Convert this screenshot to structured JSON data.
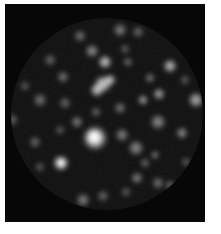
{
  "image": {
    "description": "Grayscale speckle pattern viewed through a circular aperture on a black frame with white page margin",
    "page_background_color": "#ffffff",
    "frame_color": "#070707",
    "speckle_color": "#ffffff",
    "frame": {
      "x": 5,
      "y": 4,
      "width": 200,
      "height": 218
    },
    "aperture": {
      "cx": 102,
      "cy": 110,
      "r": 96
    },
    "blobs": [
      {
        "cx": 90,
        "cy": 134,
        "r": 14,
        "o": 0.95
      },
      {
        "cx": 89,
        "cy": 133,
        "r": 9,
        "o": 1.0
      },
      {
        "cx": 56,
        "cy": 159,
        "r": 9,
        "o": 0.9
      },
      {
        "cx": 56,
        "cy": 159,
        "r": 5,
        "o": 1.0
      },
      {
        "cx": 98,
        "cy": 80,
        "r": 10,
        "o": 0.8
      },
      {
        "cx": 92,
        "cy": 86,
        "r": 8,
        "o": 0.75
      },
      {
        "cx": 105,
        "cy": 76,
        "r": 7,
        "o": 0.7
      },
      {
        "cx": 100,
        "cy": 58,
        "r": 8,
        "o": 0.75
      },
      {
        "cx": 165,
        "cy": 62,
        "r": 8,
        "o": 0.7
      },
      {
        "cx": 191,
        "cy": 96,
        "r": 9,
        "o": 0.65
      },
      {
        "cx": 154,
        "cy": 90,
        "r": 7,
        "o": 0.6
      },
      {
        "cx": 138,
        "cy": 96,
        "r": 6,
        "o": 0.6
      },
      {
        "cx": 87,
        "cy": 47,
        "r": 8,
        "o": 0.5
      },
      {
        "cx": 75,
        "cy": 32,
        "r": 7,
        "o": 0.4
      },
      {
        "cx": 115,
        "cy": 26,
        "r": 8,
        "o": 0.45
      },
      {
        "cx": 133,
        "cy": 28,
        "r": 7,
        "o": 0.35
      },
      {
        "cx": 58,
        "cy": 73,
        "r": 7,
        "o": 0.4
      },
      {
        "cx": 45,
        "cy": 56,
        "r": 7,
        "o": 0.35
      },
      {
        "cx": 35,
        "cy": 96,
        "r": 8,
        "o": 0.4
      },
      {
        "cx": 20,
        "cy": 82,
        "r": 6,
        "o": 0.3
      },
      {
        "cx": 60,
        "cy": 99,
        "r": 7,
        "o": 0.35
      },
      {
        "cx": 72,
        "cy": 118,
        "r": 7,
        "o": 0.45
      },
      {
        "cx": 131,
        "cy": 144,
        "r": 9,
        "o": 0.5
      },
      {
        "cx": 153,
        "cy": 118,
        "r": 9,
        "o": 0.5
      },
      {
        "cx": 177,
        "cy": 129,
        "r": 7,
        "o": 0.5
      },
      {
        "cx": 117,
        "cy": 131,
        "r": 8,
        "o": 0.45
      },
      {
        "cx": 145,
        "cy": 74,
        "r": 6,
        "o": 0.4
      },
      {
        "cx": 78,
        "cy": 196,
        "r": 8,
        "o": 0.45
      },
      {
        "cx": 45,
        "cy": 199,
        "r": 6,
        "o": 0.3
      },
      {
        "cx": 132,
        "cy": 174,
        "r": 7,
        "o": 0.45
      },
      {
        "cx": 153,
        "cy": 179,
        "r": 7,
        "o": 0.4
      },
      {
        "cx": 165,
        "cy": 181,
        "r": 6,
        "o": 0.35
      },
      {
        "cx": 7,
        "cy": 116,
        "r": 7,
        "o": 0.35
      },
      {
        "cx": 30,
        "cy": 138,
        "r": 7,
        "o": 0.35
      },
      {
        "cx": 150,
        "cy": 151,
        "r": 5,
        "o": 0.45
      },
      {
        "cx": 115,
        "cy": 104,
        "r": 7,
        "o": 0.4
      },
      {
        "cx": 91,
        "cy": 108,
        "r": 6,
        "o": 0.35
      },
      {
        "cx": 123,
        "cy": 58,
        "r": 6,
        "o": 0.35
      },
      {
        "cx": 181,
        "cy": 158,
        "r": 6,
        "o": 0.3
      },
      {
        "cx": 98,
        "cy": 192,
        "r": 7,
        "o": 0.35
      },
      {
        "cx": 121,
        "cy": 188,
        "r": 6,
        "o": 0.3
      },
      {
        "cx": 140,
        "cy": 159,
        "r": 6,
        "o": 0.35
      },
      {
        "cx": 55,
        "cy": 126,
        "r": 6,
        "o": 0.3
      },
      {
        "cx": 35,
        "cy": 163,
        "r": 6,
        "o": 0.3
      },
      {
        "cx": 180,
        "cy": 76,
        "r": 6,
        "o": 0.3
      },
      {
        "cx": 120,
        "cy": 45,
        "r": 6,
        "o": 0.3
      }
    ]
  }
}
